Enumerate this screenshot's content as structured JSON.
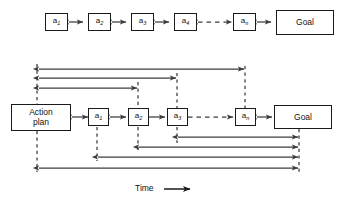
{
  "figure": {
    "title": "",
    "time_axis_label": "Time",
    "time_axis_arrow": "right-arrow"
  },
  "top_row": {
    "name": "action-sequence-chain",
    "nodes": [
      {
        "id": "a1",
        "base": "a",
        "subscript": "1"
      },
      {
        "id": "a2",
        "base": "a",
        "subscript": "2"
      },
      {
        "id": "a3",
        "base": "a",
        "subscript": "3"
      },
      {
        "id": "a4",
        "base": "a",
        "subscript": "4"
      },
      {
        "id": "an",
        "base": "a",
        "subscript": "n"
      },
      {
        "id": "goal",
        "label": "Goal"
      }
    ],
    "connectors": [
      {
        "from": "a1",
        "to": "a2",
        "style": "solid",
        "heads": "both"
      },
      {
        "from": "a2",
        "to": "a3",
        "style": "solid",
        "heads": "both"
      },
      {
        "from": "a3",
        "to": "a4",
        "style": "solid",
        "heads": "both"
      },
      {
        "from": "a4",
        "to": "an",
        "style": "dashed",
        "heads": "both"
      },
      {
        "from": "an",
        "to": "goal",
        "style": "solid",
        "heads": "both"
      }
    ]
  },
  "bottom_row": {
    "name": "action-plan-timeline",
    "nodes": [
      {
        "id": "plan",
        "label_line1": "Action",
        "label_line2": "plan"
      },
      {
        "id": "a1",
        "base": "a",
        "subscript": "1"
      },
      {
        "id": "a2",
        "base": "a",
        "subscript": "2"
      },
      {
        "id": "a3",
        "base": "a",
        "subscript": "3"
      },
      {
        "id": "an",
        "base": "a",
        "subscript": "n"
      },
      {
        "id": "goal",
        "label": "Goal"
      }
    ],
    "connectors": [
      {
        "from": "plan",
        "to": "a1",
        "style": "solid",
        "heads": "both"
      },
      {
        "from": "a1",
        "to": "a2",
        "style": "solid",
        "heads": "both"
      },
      {
        "from": "a2",
        "to": "a3",
        "style": "solid",
        "heads": "both"
      },
      {
        "from": "a3",
        "to": "an",
        "style": "dashed",
        "heads": "both"
      },
      {
        "from": "an",
        "to": "goal",
        "style": "solid",
        "heads": "both"
      }
    ],
    "feedback_arrows_above": [
      {
        "from": "an",
        "to": "plan",
        "heads": "both"
      },
      {
        "from": "a3",
        "to": "plan",
        "heads": "both"
      },
      {
        "from": "a2",
        "to": "plan",
        "heads": "both"
      }
    ],
    "feedback_arrows_below": [
      {
        "from": "goal",
        "to": "a3",
        "heads": "both"
      },
      {
        "from": "goal",
        "to": "a2",
        "heads": "both"
      },
      {
        "from": "goal",
        "to": "a1",
        "heads": "both"
      },
      {
        "from": "goal",
        "to": "plan",
        "heads": "both"
      }
    ],
    "dashed_guides_up": [
      "a2",
      "a3",
      "an"
    ],
    "dashed_guides_down": [
      "plan",
      "a1",
      "a2",
      "a3",
      "goal"
    ]
  },
  "colors": {
    "stroke": "#1a1a1a",
    "line": "#3c3c3c",
    "background": "#ffffff",
    "text": "#111111"
  }
}
